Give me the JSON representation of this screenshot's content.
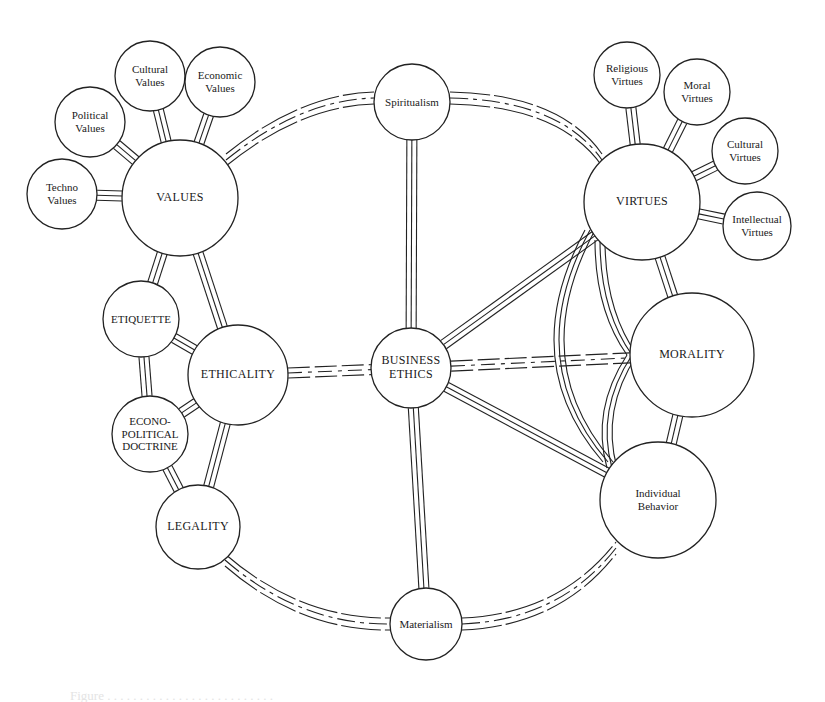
{
  "diagram": {
    "type": "network",
    "center": {
      "id": "business_ethics",
      "label": "BUSINESS\nETHICS"
    },
    "nodes": [
      {
        "id": "business_ethics",
        "label": "BUSINESS\nETHICS",
        "x": 411,
        "y": 368,
        "r": 40,
        "size": "md"
      },
      {
        "id": "spiritualism",
        "label": "Spiritualism",
        "x": 412,
        "y": 102,
        "r": 38,
        "size": "sm"
      },
      {
        "id": "materialism",
        "label": "Materialism",
        "x": 426,
        "y": 624,
        "r": 36,
        "size": "sm"
      },
      {
        "id": "values",
        "label": "VALUES",
        "x": 180,
        "y": 198,
        "r": 58,
        "size": "md"
      },
      {
        "id": "techno_values",
        "label": "Techno\nValues",
        "x": 62,
        "y": 194,
        "r": 35,
        "size": "sm"
      },
      {
        "id": "political_values",
        "label": "Political\nValues",
        "x": 90,
        "y": 122,
        "r": 35,
        "size": "sm"
      },
      {
        "id": "cultural_values",
        "label": "Cultural\nValues",
        "x": 150,
        "y": 76,
        "r": 35,
        "size": "sm"
      },
      {
        "id": "economic_values",
        "label": "Economic\nValues",
        "x": 220,
        "y": 82,
        "r": 35,
        "size": "sm"
      },
      {
        "id": "etiquette",
        "label": "ETIQUETTE",
        "x": 141,
        "y": 319,
        "r": 38,
        "size": "sm"
      },
      {
        "id": "ethicality",
        "label": "ETHICALITY",
        "x": 238,
        "y": 375,
        "r": 50,
        "size": "md"
      },
      {
        "id": "econo_political_doctrine",
        "label": "ECONO-\nPOLITICAL\nDOCTRINE",
        "x": 150,
        "y": 434,
        "r": 38,
        "size": "sm"
      },
      {
        "id": "legality",
        "label": "LEGALITY",
        "x": 198,
        "y": 527,
        "r": 42,
        "size": "md"
      },
      {
        "id": "virtues",
        "label": "VIRTUES",
        "x": 642,
        "y": 202,
        "r": 58,
        "size": "md"
      },
      {
        "id": "religious_virtues",
        "label": "Religious\nVirtues",
        "x": 627,
        "y": 75,
        "r": 33,
        "size": "sm"
      },
      {
        "id": "moral_virtues",
        "label": "Moral\nVirtues",
        "x": 697,
        "y": 92,
        "r": 33,
        "size": "sm"
      },
      {
        "id": "cultural_virtues",
        "label": "Cultural\nVirtues",
        "x": 745,
        "y": 151,
        "r": 33,
        "size": "sm"
      },
      {
        "id": "intellectual_virtues",
        "label": "Intellectual\nVirtues",
        "x": 757,
        "y": 226,
        "r": 34,
        "size": "sm"
      },
      {
        "id": "morality",
        "label": "MORALITY",
        "x": 692,
        "y": 355,
        "r": 62,
        "size": "md"
      },
      {
        "id": "individual_behavior",
        "label": "Individual\nBehavior",
        "x": 658,
        "y": 500,
        "r": 58,
        "size": "sm"
      }
    ],
    "edges": [
      {
        "from": "values",
        "to": "techno_values",
        "style": "solid"
      },
      {
        "from": "values",
        "to": "political_values",
        "style": "solid"
      },
      {
        "from": "values",
        "to": "cultural_values",
        "style": "solid"
      },
      {
        "from": "values",
        "to": "economic_values",
        "style": "solid"
      },
      {
        "from": "values",
        "to": "etiquette",
        "style": "solid"
      },
      {
        "from": "values",
        "to": "ethicality",
        "style": "solid"
      },
      {
        "from": "etiquette",
        "to": "ethicality",
        "style": "solid"
      },
      {
        "from": "etiquette",
        "to": "econo_political_doctrine",
        "style": "solid"
      },
      {
        "from": "econo_political_doctrine",
        "to": "ethicality",
        "style": "solid"
      },
      {
        "from": "econo_political_doctrine",
        "to": "legality",
        "style": "solid"
      },
      {
        "from": "ethicality",
        "to": "legality",
        "style": "solid"
      },
      {
        "from": "ethicality",
        "to": "business_ethics",
        "style": "dashed"
      },
      {
        "from": "spiritualism",
        "to": "business_ethics",
        "style": "solid"
      },
      {
        "from": "business_ethics",
        "to": "materialism",
        "style": "solid"
      },
      {
        "from": "business_ethics",
        "to": "virtues",
        "style": "solid"
      },
      {
        "from": "business_ethics",
        "to": "morality",
        "style": "dashed"
      },
      {
        "from": "business_ethics",
        "to": "individual_behavior",
        "style": "solid"
      },
      {
        "from": "virtues",
        "to": "religious_virtues",
        "style": "solid"
      },
      {
        "from": "virtues",
        "to": "moral_virtues",
        "style": "solid"
      },
      {
        "from": "virtues",
        "to": "cultural_virtues",
        "style": "solid"
      },
      {
        "from": "virtues",
        "to": "intellectual_virtues",
        "style": "solid"
      },
      {
        "from": "virtues",
        "to": "morality",
        "style": "solid"
      },
      {
        "from": "morality",
        "to": "individual_behavior",
        "style": "solid"
      },
      {
        "from": "virtues",
        "to": "individual_behavior",
        "style": "arc"
      },
      {
        "from": "virtues",
        "to": "morality",
        "style": "arc"
      },
      {
        "from": "morality",
        "to": "individual_behavior",
        "style": "arc"
      },
      {
        "from": "values",
        "to": "spiritualism",
        "style": "arc-dashed"
      },
      {
        "from": "spiritualism",
        "to": "virtues",
        "style": "arc-dashed"
      },
      {
        "from": "legality",
        "to": "materialism",
        "style": "arc-dashed"
      },
      {
        "from": "materialism",
        "to": "individual_behavior",
        "style": "arc-dashed"
      }
    ]
  },
  "caption": "Figure . . . . . . . . . . . . . . . . . . . . . . . . . ."
}
